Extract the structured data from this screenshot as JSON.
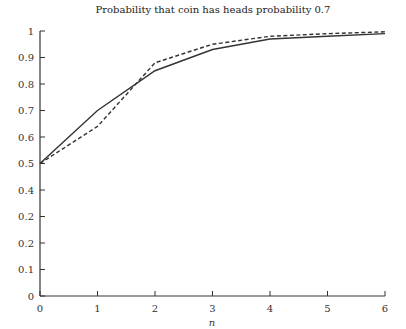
{
  "chart_data": {
    "type": "line",
    "title": "Probability that coin has heads probability 0.7",
    "xlabel": "n",
    "ylabel": "",
    "x": [
      0,
      1,
      2,
      3,
      4,
      5,
      6
    ],
    "xlim": [
      0,
      6
    ],
    "ylim": [
      0,
      1
    ],
    "x_ticks": [
      "0",
      "1",
      "2",
      "3",
      "4",
      "5",
      "6"
    ],
    "y_ticks": [
      {
        "value": 0,
        "label": "0"
      },
      {
        "value": 0.1,
        "label": "0.1"
      },
      {
        "value": 0.2,
        "label": "0.2"
      },
      {
        "value": 0.3,
        "label": "0.2"
      },
      {
        "value": 0.4,
        "label": "0.4"
      },
      {
        "value": 0.5,
        "label": "0.5"
      },
      {
        "value": 0.6,
        "label": "0.6"
      },
      {
        "value": 0.7,
        "label": "0.7"
      },
      {
        "value": 0.8,
        "label": "0.8"
      },
      {
        "value": 0.9,
        "label": "0.9"
      },
      {
        "value": 1,
        "label": "1"
      }
    ],
    "grid": false,
    "legend": null,
    "series": [
      {
        "name": "solid",
        "style": "solid",
        "color": "#333333",
        "values": [
          0.5,
          0.7,
          0.85,
          0.93,
          0.97,
          0.98,
          0.99
        ]
      },
      {
        "name": "dashed",
        "style": "dashed",
        "color": "#333333",
        "values": [
          0.5,
          0.64,
          0.88,
          0.95,
          0.98,
          0.99,
          0.997
        ]
      }
    ]
  }
}
